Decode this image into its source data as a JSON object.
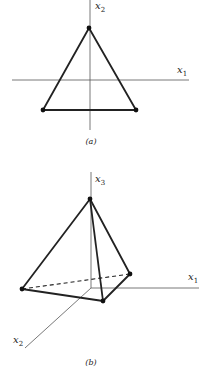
{
  "figure_a": {
    "caption": "(a)",
    "axis_x_label": "x",
    "axis_x_sub": "1",
    "axis_y_label": "x",
    "axis_y_sub": "2"
  },
  "figure_b": {
    "caption": "(b)",
    "axis_x1_label": "x",
    "axis_x1_sub": "1",
    "axis_x2_label": "x",
    "axis_x2_sub": "2",
    "axis_x3_label": "x",
    "axis_x3_sub": "3"
  },
  "colors": {
    "line": "#222222",
    "axis": "#555555"
  }
}
